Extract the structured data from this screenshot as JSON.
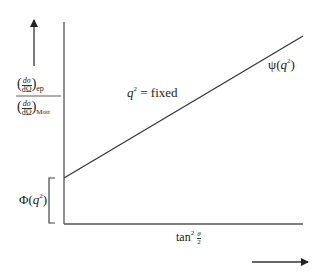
{
  "diagram": {
    "type": "line-plot-schematic",
    "y_axis_label": {
      "numerator": "(dσ/dΩ)",
      "numerator_subscript": "ep",
      "denominator": "(dσ/dΩ)",
      "denominator_subscript": "Mott"
    },
    "x_axis_label": {
      "text": "tan",
      "superscript": "2",
      "fraction_num": "θ",
      "fraction_den": "2"
    },
    "line_annotation": {
      "var": "q",
      "sup": "2",
      "rest": " = fixed"
    },
    "slope_label": {
      "func": "ψ(",
      "var": "q",
      "sup": "2",
      "close": ")"
    },
    "intercept_label": {
      "func": "Φ(",
      "var": "q",
      "sup": "2",
      "close": ")"
    },
    "colors": {
      "line": "#333333",
      "axis": "#555555",
      "background": "#ffffff"
    }
  }
}
